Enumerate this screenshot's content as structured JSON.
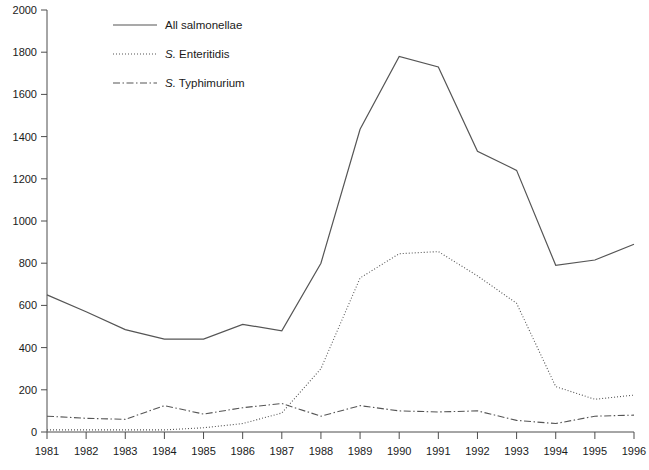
{
  "chart_data": {
    "type": "line",
    "title": "",
    "subtitle": "",
    "xlabel": "",
    "ylabel": "",
    "grid": false,
    "legend_position": "top-left-inside",
    "x": [
      1981,
      1982,
      1983,
      1984,
      1985,
      1986,
      1987,
      1988,
      1989,
      1990,
      1991,
      1992,
      1993,
      1994,
      1995,
      1996
    ],
    "categories": [
      "1981",
      "1982",
      "1983",
      "1984",
      "1985",
      "1986",
      "1987",
      "1988",
      "1989",
      "1990",
      "1991",
      "1992",
      "1993",
      "1994",
      "1995",
      "1996"
    ],
    "xlim": [
      1981,
      1996
    ],
    "ylim": [
      0,
      2000
    ],
    "ytick_labels": [
      "0",
      "200",
      "400",
      "600",
      "800",
      "1000",
      "1200",
      "1400",
      "1600",
      "1800",
      "2000"
    ],
    "yticks": [
      0,
      200,
      400,
      600,
      800,
      1000,
      1200,
      1400,
      1600,
      1800,
      2000
    ],
    "series": [
      {
        "name": "All salmonellae",
        "style": "solid",
        "color": "#555555",
        "values": [
          650,
          570,
          485,
          440,
          440,
          510,
          480,
          800,
          1435,
          1780,
          1730,
          1330,
          1240,
          790,
          815,
          890
        ]
      },
      {
        "name": "S. Enteritidis",
        "style": "dotted",
        "color": "#555555",
        "values": [
          10,
          10,
          10,
          10,
          20,
          40,
          90,
          300,
          730,
          845,
          855,
          740,
          610,
          215,
          155,
          175
        ]
      },
      {
        "name": "S. Typhimurium",
        "style": "dash-dot",
        "color": "#555555",
        "values": [
          75,
          65,
          60,
          125,
          85,
          115,
          135,
          75,
          125,
          100,
          95,
          100,
          55,
          40,
          75,
          80
        ]
      }
    ]
  },
  "legend": {
    "items": [
      {
        "prefix": "",
        "italic": "",
        "label": "All salmonellae",
        "style": "solid"
      },
      {
        "prefix": "",
        "italic": "S.",
        "label": " Enteritidis",
        "style": "dotted"
      },
      {
        "prefix": "",
        "italic": "S.",
        "label": " Typhimurium",
        "style": "dash-dot"
      }
    ]
  }
}
